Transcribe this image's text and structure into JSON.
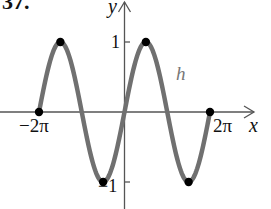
{
  "problem_number": "37.",
  "chart_data": {
    "type": "line",
    "title": "",
    "function_label": "h",
    "function": "h(x) = sin x",
    "xlabel": "x",
    "ylabel": "y",
    "x_ticks": [
      "-2π",
      "2π"
    ],
    "y_ticks": [
      "1",
      "-1"
    ],
    "xlim": [
      -6.2832,
      6.2832
    ],
    "ylim": [
      -1,
      1
    ],
    "grid": false,
    "series": [
      {
        "name": "h",
        "x": [
          -6.2832,
          -4.7124,
          -1.5708,
          0,
          1.5708,
          4.7124,
          6.2832
        ],
        "y": [
          0,
          1,
          -1,
          0,
          1,
          -1,
          0
        ]
      }
    ],
    "marked_points": [
      {
        "x": "-2π",
        "y": 0
      },
      {
        "x": "-3π/2",
        "y": 1
      },
      {
        "x": "-π/2",
        "y": -1
      },
      {
        "x": "π/2",
        "y": 1
      },
      {
        "x": "3π/2",
        "y": -1
      },
      {
        "x": "2π",
        "y": 0
      }
    ]
  },
  "labels": {
    "y_axis": "y",
    "x_axis": "x",
    "tick_one": "1",
    "tick_neg_one": "−1",
    "tick_neg_two_pi": "−2π",
    "tick_two_pi": "2π",
    "curve": "h"
  },
  "colors": {
    "curve": "#707070",
    "axis": "#555555",
    "point": "#000000",
    "curve_label": "#777777"
  }
}
